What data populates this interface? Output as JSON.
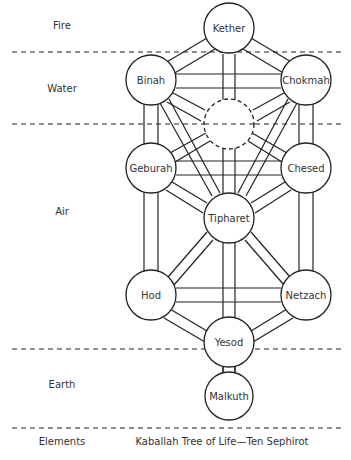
{
  "elements": {
    "fire": "Fire",
    "water": "Water",
    "air": "Air",
    "earth": "Earth",
    "heading": "Elements"
  },
  "caption": "Kaballah Tree of Life—Ten Sephirot",
  "sephirot": {
    "kether": "Kether",
    "binah": "Binah",
    "chokmah": "Chokmah",
    "geburah": "Geburah",
    "chesed": "Chesed",
    "tipharet": "Tipharet",
    "hod": "Hod",
    "netzach": "Netzach",
    "yesod": "Yesod",
    "malkuth": "Malkuth"
  },
  "colors": {
    "stroke": "#222222",
    "text": "#333333",
    "background": "#ffffff"
  }
}
